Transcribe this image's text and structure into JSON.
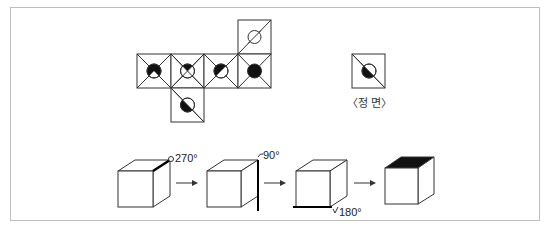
{
  "figure": {
    "net": {
      "description": "cube net with six faces",
      "faces": [
        {
          "id": "top",
          "pattern": "diagonal-slash",
          "circle": "empty"
        },
        {
          "id": "row-1",
          "pattern": "x-diagonals",
          "circle": "filled-except-bottom-wedge"
        },
        {
          "id": "row-2",
          "pattern": "x-diagonals",
          "circle": "top-wedge-filled"
        },
        {
          "id": "row-3",
          "pattern": "x-diagonals",
          "circle": "upper-left-half-filled"
        },
        {
          "id": "row-4",
          "pattern": "x-diagonals",
          "circle": "fully-filled"
        },
        {
          "id": "bottom",
          "pattern": "diagonal-backslash",
          "circle": "lower-left-half-filled"
        }
      ]
    },
    "front_view": {
      "pattern": "diagonal-backslash",
      "circle": "lower-left-half-filled",
      "caption": "〈정 면〉"
    },
    "rotation_sequence": {
      "steps": [
        {
          "cube": 1,
          "highlight": "top-right-edge",
          "angle_label": "270°"
        },
        {
          "cube": 2,
          "highlight": "right-vertical-edge",
          "angle_label": "90°"
        },
        {
          "cube": 3,
          "highlight": "bottom-front-edge",
          "angle_label": "180°"
        },
        {
          "cube": 4,
          "highlight": "top-face-filled",
          "angle_label": ""
        }
      ],
      "arrow_icon": "right-arrow"
    },
    "colors": {
      "line": "#333333",
      "fill": "#111111",
      "frame": "#bdbdbd"
    }
  }
}
